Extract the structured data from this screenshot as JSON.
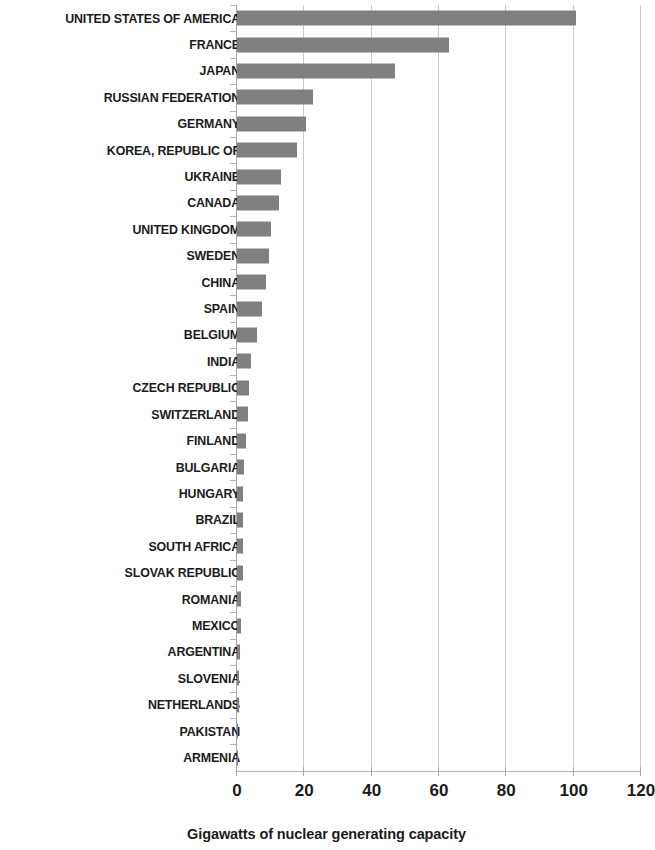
{
  "chart_data": {
    "type": "bar",
    "orientation": "horizontal",
    "title": "",
    "xlabel": "Gigawatts of nuclear generating capacity",
    "ylabel": "",
    "xlim": [
      0,
      120
    ],
    "xticks": [
      0,
      20,
      40,
      60,
      80,
      100,
      120
    ],
    "xtick_labels": [
      "0",
      "20",
      "40",
      "60",
      "80",
      "100",
      "120"
    ],
    "grid": true,
    "legend": null,
    "bar_color": "#808080",
    "gridline_color": "#c9c9c9",
    "axis_color": "#a8a8a8",
    "text_color": "#1b1b1b",
    "background": "#ffffff",
    "categories": [
      "UNITED STATES OF AMERICA",
      "FRANCE",
      "JAPAN",
      "RUSSIAN FEDERATION",
      "GERMANY",
      "KOREA, REPUBLIC OF",
      "UKRAINE",
      "CANADA",
      "UNITED KINGDOM",
      "SWEDEN",
      "CHINA",
      "SPAIN",
      "BELGIUM",
      "INDIA",
      "CZECH REPUBLIC",
      "SWITZERLAND",
      "FINLAND",
      "BULGARIA",
      "HUNGARY",
      "BRAZIL",
      "SOUTH AFRICA",
      "SLOVAK REPUBLIC",
      "ROMANIA",
      "MEXICO",
      "ARGENTINA",
      "SLOVENIA",
      "NETHERLANDS",
      "PAKISTAN",
      "ARMENIA"
    ],
    "values": [
      100.6,
      63.1,
      46.8,
      22.7,
      20.5,
      17.7,
      13.1,
      12.6,
      10.2,
      9.4,
      8.6,
      7.5,
      5.8,
      4.2,
      3.6,
      3.2,
      2.7,
      2.0,
      1.9,
      1.9,
      1.8,
      1.8,
      1.3,
      1.3,
      0.9,
      0.7,
      0.5,
      0.3,
      0.4
    ]
  }
}
